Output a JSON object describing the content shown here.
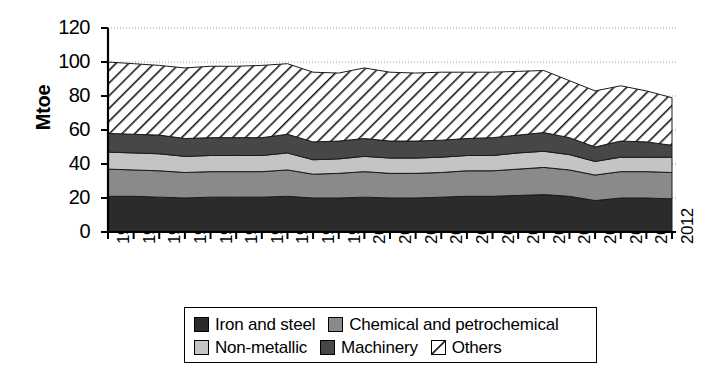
{
  "chart_data": {
    "type": "area",
    "title": "",
    "subtitle": "",
    "xlabel": "",
    "ylabel": "Mtoe",
    "stacked": true,
    "grid": true,
    "legend_position": "bottom",
    "ylim": [
      0,
      120
    ],
    "yticks": [
      0,
      20,
      40,
      60,
      80,
      100,
      120
    ],
    "categories": [
      "1990",
      "1991",
      "1992",
      "1993",
      "1994",
      "1995",
      "1996",
      "1997",
      "1998",
      "1999",
      "2000",
      "2001",
      "2002",
      "2003",
      "2004",
      "2005",
      "2006",
      "2007",
      "2008",
      "2009",
      "2010",
      "2011",
      "2012"
    ],
    "series": [
      {
        "name": "Iron and steel",
        "color": "#2b2b2b",
        "pattern": "solid",
        "values": [
          21.0,
          21.0,
          20.5,
          20.0,
          20.5,
          20.5,
          20.5,
          21.0,
          20.0,
          20.0,
          20.5,
          20.0,
          20.0,
          20.5,
          21.0,
          21.0,
          21.5,
          22.0,
          21.0,
          18.5,
          20.0,
          20.0,
          19.5
        ]
      },
      {
        "name": "Chemical and petrochemical",
        "color": "#8a8a8a",
        "pattern": "solid",
        "values": [
          16.0,
          15.5,
          15.5,
          15.0,
          15.0,
          15.0,
          15.0,
          15.5,
          14.0,
          14.5,
          15.0,
          14.5,
          14.5,
          14.5,
          15.0,
          15.0,
          15.5,
          16.0,
          15.5,
          15.0,
          15.5,
          15.5,
          15.5
        ]
      },
      {
        "name": "Non-metallic",
        "color": "#c4c4c4",
        "pattern": "solid",
        "values": [
          10.0,
          10.0,
          10.0,
          9.5,
          9.5,
          9.5,
          9.5,
          10.0,
          8.5,
          8.5,
          9.0,
          9.0,
          9.0,
          9.0,
          9.0,
          9.0,
          9.5,
          9.5,
          9.0,
          8.0,
          8.5,
          8.5,
          9.0
        ]
      },
      {
        "name": "Machinery",
        "color": "#474747",
        "pattern": "solid",
        "values": [
          11.0,
          11.0,
          11.0,
          10.5,
          10.5,
          10.5,
          10.5,
          11.0,
          10.5,
          10.5,
          10.5,
          10.0,
          10.0,
          10.0,
          10.0,
          10.5,
          10.5,
          11.0,
          10.0,
          8.5,
          9.5,
          9.0,
          7.0
        ]
      },
      {
        "name": "Others",
        "color": "#ffffff",
        "pattern": "diagonal-hatch",
        "values": [
          42.0,
          41.5,
          41.0,
          41.5,
          42.0,
          42.0,
          42.5,
          41.5,
          41.0,
          40.0,
          41.5,
          40.5,
          40.0,
          40.0,
          39.0,
          38.5,
          37.5,
          36.5,
          33.5,
          33.0,
          32.5,
          30.0,
          28.0
        ]
      }
    ],
    "totals": [
      100.0,
      99.0,
      98.0,
      96.5,
      97.5,
      97.5,
      98.0,
      99.0,
      94.0,
      93.5,
      96.5,
      94.0,
      93.5,
      94.0,
      94.0,
      94.0,
      94.5,
      95.0,
      89.0,
      83.0,
      86.0,
      83.0,
      79.0
    ]
  },
  "legend": {
    "entries": [
      {
        "label": "Iron and steel",
        "swatch": "dark-solid-swatch"
      },
      {
        "label": "Chemical and petrochemical",
        "swatch": "medium-gray-solid-swatch"
      },
      {
        "label": "Non-metallic",
        "swatch": "light-gray-solid-swatch"
      },
      {
        "label": "Machinery",
        "swatch": "dark-gray-solid-swatch"
      },
      {
        "label": "Others",
        "swatch": "diagonal-hatch-swatch"
      }
    ]
  },
  "axes": {
    "y_title": "Mtoe"
  }
}
